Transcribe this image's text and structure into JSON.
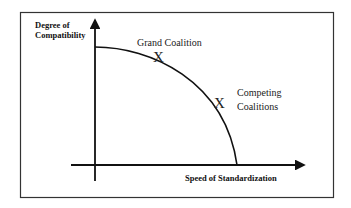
{
  "diagram": {
    "y_axis": {
      "label_line1": "Degree of",
      "label_line2": "Compatibility"
    },
    "x_axis": {
      "label": "Speed of Standardization"
    },
    "points": [
      {
        "marker": "X",
        "label": "Grand Coalition"
      },
      {
        "marker": "X",
        "label_line1": "Competing",
        "label_line2": "Coalitions"
      }
    ],
    "colors": {
      "line": "#111111",
      "frame": "#333333",
      "background": "#ffffff"
    }
  }
}
